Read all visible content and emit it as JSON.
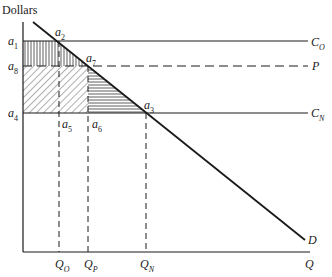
{
  "diagram": {
    "y_axis_label": "Dollars",
    "x_axis_label": "Q",
    "curves": {
      "demand": "D",
      "cost_old": {
        "main": "C",
        "sub": "O"
      },
      "price": "P",
      "cost_new": {
        "main": "C",
        "sub": "N"
      }
    },
    "y_ticks": [
      {
        "main": "a",
        "sub": "1"
      },
      {
        "main": "a",
        "sub": "8"
      },
      {
        "main": "a",
        "sub": "4"
      }
    ],
    "points": [
      {
        "main": "a",
        "sub": "2"
      },
      {
        "main": "a",
        "sub": "7"
      },
      {
        "main": "a",
        "sub": "3"
      },
      {
        "main": "a",
        "sub": "5"
      },
      {
        "main": "a",
        "sub": "6"
      }
    ],
    "x_ticks": [
      {
        "main": "Q",
        "sub": "O"
      },
      {
        "main": "Q",
        "sub": "P"
      },
      {
        "main": "Q",
        "sub": "N"
      }
    ],
    "colors": {
      "ink": "#1a1a1a",
      "background": "#ffffff"
    }
  }
}
